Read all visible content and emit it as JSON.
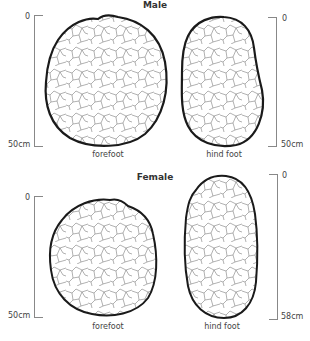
{
  "panels": [
    {
      "title": "Male",
      "left_scale": {
        "top": "0",
        "bottom": "50cm"
      },
      "right_scale": {
        "top": "0",
        "bottom": "50cm"
      },
      "captions": {
        "left": "forefoot",
        "right": "hind foot"
      }
    },
    {
      "title": "Female",
      "left_scale": {
        "top": "0",
        "bottom": "50cm"
      },
      "right_scale": {
        "top": "0",
        "bottom": "58cm"
      },
      "captions": {
        "left": "forefoot",
        "right": "hind foot"
      }
    }
  ],
  "colors": {
    "outline": "#1a1a1a",
    "cracks": "#6a6a6a",
    "scale": "#888888"
  }
}
